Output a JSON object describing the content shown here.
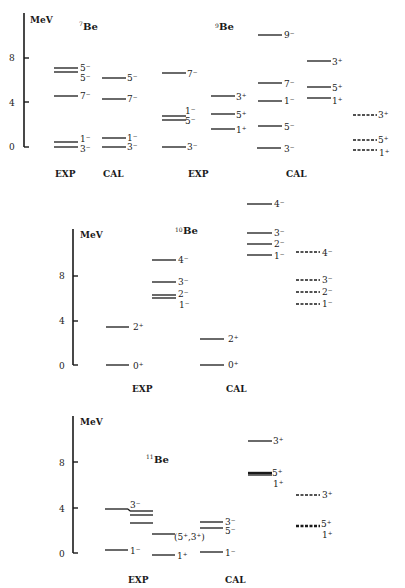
{
  "figure": {
    "panels": [
      {
        "id": "be7-be9",
        "axis": {
          "label": "MeV",
          "ticks": [
            "0",
            "4",
            "8"
          ]
        },
        "nuclei": [
          {
            "name": "Be",
            "mass": "7",
            "columns": [
              {
                "label": "EXP",
                "style": "solid",
                "levels": [
                  {
                    "E": 0.0,
                    "jpi": "3⁻"
                  },
                  {
                    "E": 0.43,
                    "jpi": "1⁻"
                  },
                  {
                    "E": 4.57,
                    "jpi": "7⁻"
                  },
                  {
                    "E": 6.73,
                    "jpi": "5⁻"
                  },
                  {
                    "E": 7.21,
                    "jpi": "5⁻"
                  }
                ]
              },
              {
                "label": "CAL",
                "style": "solid",
                "levels": [
                  {
                    "E": 0.0,
                    "jpi": "3⁻"
                  },
                  {
                    "E": 0.85,
                    "jpi": "1⁻"
                  },
                  {
                    "E": 4.3,
                    "jpi": "7⁻"
                  },
                  {
                    "E": 6.2,
                    "jpi": "5⁻"
                  }
                ]
              }
            ]
          },
          {
            "name": "Be",
            "mass": "9",
            "columns": [
              {
                "label": "EXP",
                "style": "solid",
                "levels": [
                  {
                    "E": 0.0,
                    "jpi": "3⁻"
                  },
                  {
                    "E": 2.43,
                    "jpi": "5⁻"
                  },
                  {
                    "E": 2.78,
                    "jpi": "1⁻"
                  },
                  {
                    "E": 6.7,
                    "jpi": "7⁻"
                  },
                  {
                    "E": 1.68,
                    "jpi": "1⁺"
                  },
                  {
                    "E": 3.05,
                    "jpi": "5⁺"
                  },
                  {
                    "E": 4.7,
                    "jpi": "3⁺"
                  }
                ]
              },
              {
                "label": "CAL",
                "style": "solid",
                "levels": [
                  {
                    "E": 0.0,
                    "jpi": "3⁻"
                  },
                  {
                    "E": 2.0,
                    "jpi": "5⁻"
                  },
                  {
                    "E": 4.2,
                    "jpi": "1⁻"
                  },
                  {
                    "E": 5.8,
                    "jpi": "7⁻"
                  },
                  {
                    "E": 10.0,
                    "jpi": "9⁻"
                  },
                  {
                    "E": 4.5,
                    "jpi": "1⁺"
                  },
                  {
                    "E": 5.5,
                    "jpi": "5⁺"
                  },
                  {
                    "E": 7.8,
                    "jpi": "3⁺"
                  }
                ]
              },
              {
                "label": "",
                "style": "dashed",
                "levels": [
                  {
                    "E": -0.2,
                    "jpi": "1⁺"
                  },
                  {
                    "E": 0.6,
                    "jpi": "5⁺"
                  },
                  {
                    "E": 3.0,
                    "jpi": "3⁺"
                  }
                ]
              }
            ]
          }
        ]
      },
      {
        "id": "be10",
        "axis": {
          "label": "MeV",
          "ticks": [
            "0",
            "4",
            "8"
          ]
        },
        "nuclei": [
          {
            "name": "Be",
            "mass": "10",
            "columns": [
              {
                "label": "EXP",
                "style": "solid",
                "levels": [
                  {
                    "E": 0.0,
                    "jpi": "0⁺"
                  },
                  {
                    "E": 3.37,
                    "jpi": "2⁺"
                  },
                  {
                    "E": 5.96,
                    "jpi": "1⁻"
                  },
                  {
                    "E": 6.26,
                    "jpi": "2⁻"
                  },
                  {
                    "E": 7.37,
                    "jpi": "3⁻"
                  },
                  {
                    "E": 9.27,
                    "jpi": "4⁻"
                  }
                ]
              },
              {
                "label": "CAL",
                "style": "solid",
                "levels": [
                  {
                    "E": 0.0,
                    "jpi": "0⁺"
                  },
                  {
                    "E": 2.3,
                    "jpi": "2⁺"
                  },
                  {
                    "E": 9.8,
                    "jpi": "1⁻"
                  },
                  {
                    "E": 10.8,
                    "jpi": "2⁻"
                  },
                  {
                    "E": 11.9,
                    "jpi": "3⁻"
                  },
                  {
                    "E": 14.5,
                    "jpi": "4⁻"
                  }
                ]
              },
              {
                "label": "",
                "style": "dashed",
                "levels": [
                  {
                    "E": 5.5,
                    "jpi": "1⁻"
                  },
                  {
                    "E": 6.5,
                    "jpi": "2⁻"
                  },
                  {
                    "E": 7.6,
                    "jpi": "3⁻"
                  },
                  {
                    "E": 10.1,
                    "jpi": "4⁻"
                  }
                ]
              }
            ]
          }
        ]
      },
      {
        "id": "be11",
        "axis": {
          "label": "MeV",
          "ticks": [
            "0",
            "4",
            "8"
          ]
        },
        "nuclei": [
          {
            "name": "Be",
            "mass": "11",
            "columns": [
              {
                "label": "EXP",
                "style": "solid",
                "levels": [
                  {
                    "E": 0.32,
                    "jpi": "1⁻"
                  },
                  {
                    "E": 3.96,
                    "jpi": "3⁻"
                  },
                  {
                    "E": 2.7,
                    "jpi": ""
                  },
                  {
                    "E": 3.4,
                    "jpi": ""
                  },
                  {
                    "E": 3.9,
                    "jpi": ""
                  },
                  {
                    "E": 0.0,
                    "jpi": "1⁺"
                  },
                  {
                    "E": 1.78,
                    "jpi": "(5⁺,3⁺)"
                  }
                ]
              },
              {
                "label": "CAL",
                "style": "solid",
                "levels": [
                  {
                    "E": 0.2,
                    "jpi": "1⁻"
                  },
                  {
                    "E": 2.3,
                    "jpi": "5⁻"
                  },
                  {
                    "E": 2.8,
                    "jpi": "3⁻"
                  },
                  {
                    "E": 6.9,
                    "jpi": "1⁺"
                  },
                  {
                    "E": 7.0,
                    "jpi": "5⁺"
                  },
                  {
                    "E": 9.8,
                    "jpi": "3⁺"
                  }
                ]
              },
              {
                "label": "",
                "style": "dashed",
                "levels": [
                  {
                    "E": 2.4,
                    "jpi": "1⁺"
                  },
                  {
                    "E": 2.5,
                    "jpi": "5⁺"
                  },
                  {
                    "E": 5.1,
                    "jpi": "3⁺"
                  }
                ]
              }
            ]
          }
        ]
      }
    ],
    "text": {
      "mev": "MeV",
      "exp": "EXP",
      "cal": "CAL",
      "be": "Be",
      "m7": "7",
      "m9": "9",
      "m10": "10",
      "m11": "11",
      "t0": "0",
      "t4": "4",
      "t8": "8",
      "j": {
        "a1": "5⁻",
        "a2": "5⁻",
        "a3": "7⁻",
        "a4": "1⁻",
        "a5": "3⁻",
        "b1": "5⁻",
        "b2": "7⁻",
        "b3": "1⁻",
        "b4": "3⁻",
        "c1": "7⁻",
        "c2": "1⁻",
        "c3": "5⁻",
        "c4": "3⁻",
        "d1": "3⁺",
        "d2": "5⁺",
        "d3": "1⁺",
        "e1": "9⁻",
        "e2": "7⁻",
        "e3": "1⁻",
        "e4": "5⁻",
        "e5": "3⁻",
        "f1": "3⁺",
        "f2": "5⁺",
        "f3": "1⁺",
        "g1": "3⁺",
        "g2": "5⁺",
        "g3": "1⁺",
        "h1": "4⁻",
        "h2": "3⁻",
        "h3": "2⁻",
        "h4": "1⁻",
        "h5": "2⁺",
        "h6": "0⁺",
        "i1": "4⁻",
        "i2": "3⁻",
        "i3": "2⁻",
        "i4": "1⁻",
        "i5": "2⁺",
        "i6": "0⁺",
        "k1": "4⁻",
        "k2": "3⁻",
        "k3": "2⁻",
        "k4": "1⁻",
        "l1": "3⁻",
        "l2": "1⁻",
        "l3": "(5⁺,3⁺)",
        "l4": "1⁺",
        "m1": "3⁻",
        "m2": "5⁻",
        "m3": "1⁻",
        "n1": "3⁺",
        "n2": "5⁺",
        "n3": "1⁺",
        "o1": "3⁺",
        "o2": "5⁺",
        "o3": "1⁺"
      }
    }
  }
}
